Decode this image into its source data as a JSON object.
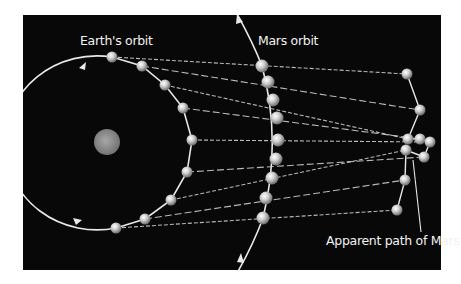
{
  "diagram": {
    "labels": {
      "earth_orbit": "Earth's orbit",
      "mars_orbit": "Mars orbit",
      "apparent_path": "Apparent path of Mars"
    },
    "colors": {
      "background": "#080808",
      "page": "#ffffff",
      "orbit_line": "#e8e8e8",
      "sight_line": "#d8d8d8",
      "planet": "#cfcfcf",
      "sun": "#8a8a8a",
      "text": "#f2f2f2"
    },
    "earth_positions": [
      [
        112,
        57
      ],
      [
        142,
        66
      ],
      [
        165,
        85
      ],
      [
        183,
        108
      ],
      [
        192,
        140
      ],
      [
        187,
        172
      ],
      [
        171,
        200
      ],
      [
        145,
        219
      ],
      [
        116,
        228
      ]
    ],
    "mars_positions": [
      [
        262,
        66
      ],
      [
        268,
        82
      ],
      [
        273,
        100
      ],
      [
        277,
        118
      ],
      [
        278,
        140
      ],
      [
        276,
        159
      ],
      [
        272,
        178
      ],
      [
        266,
        198
      ],
      [
        263,
        218
      ]
    ],
    "apparent_positions": [
      [
        407,
        74
      ],
      [
        420,
        110
      ],
      [
        408,
        139
      ],
      [
        420,
        139
      ],
      [
        430,
        142
      ],
      [
        424,
        157
      ],
      [
        406,
        150
      ],
      [
        405,
        180
      ],
      [
        397,
        210
      ]
    ]
  }
}
